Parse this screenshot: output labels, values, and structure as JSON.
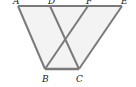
{
  "diagram": {
    "type": "geometry",
    "points": {
      "A": {
        "label": "A",
        "x": 18,
        "y": 6
      },
      "D": {
        "label": "D",
        "x": 50,
        "y": 6
      },
      "F": {
        "label": "F",
        "x": 88,
        "y": 6
      },
      "E": {
        "label": "E",
        "x": 122,
        "y": 6
      },
      "B": {
        "label": "B",
        "x": 45,
        "y": 69
      },
      "C": {
        "label": "C",
        "x": 79,
        "y": 69
      }
    },
    "segments": [
      "AE",
      "AB",
      "DC",
      "FB",
      "EC",
      "BC"
    ],
    "colors": {
      "line": "#7a7a7a",
      "fill": "#f0f0f0"
    }
  }
}
